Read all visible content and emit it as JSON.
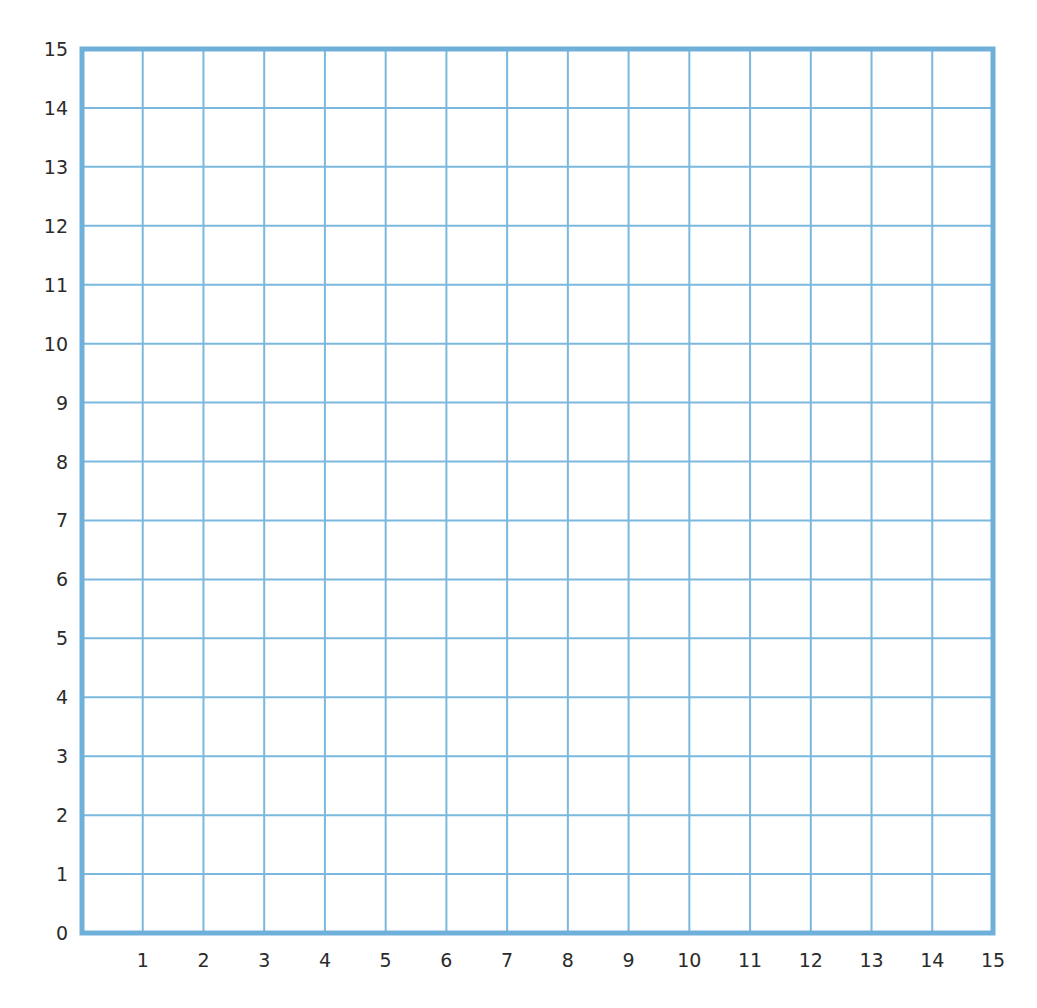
{
  "chart_data": {
    "type": "grid",
    "title": "",
    "xlabel": "",
    "ylabel": "",
    "xlim": [
      0,
      15
    ],
    "ylim": [
      0,
      15
    ],
    "x_ticks": [
      1,
      2,
      3,
      4,
      5,
      6,
      7,
      8,
      9,
      10,
      11,
      12,
      13,
      14,
      15
    ],
    "y_ticks": [
      0,
      1,
      2,
      3,
      4,
      5,
      6,
      7,
      8,
      9,
      10,
      11,
      12,
      13,
      14,
      15
    ],
    "x_tick_labels": [
      "1",
      "2",
      "3",
      "4",
      "5",
      "6",
      "7",
      "8",
      "9",
      "10",
      "11",
      "12",
      "13",
      "14",
      "15"
    ],
    "y_tick_labels": [
      "0",
      "1",
      "2",
      "3",
      "4",
      "5",
      "6",
      "7",
      "8",
      "9",
      "10",
      "11",
      "12",
      "13",
      "14",
      "15"
    ],
    "grid": true,
    "series": [],
    "legend": null
  },
  "style": {
    "grid_color": "#7ab8dd",
    "border_color": "#6fb0da",
    "label_color": "#2b2b2b"
  },
  "layout": {
    "plot_left": 82,
    "plot_right": 993,
    "plot_top": 49,
    "plot_bottom": 933
  }
}
